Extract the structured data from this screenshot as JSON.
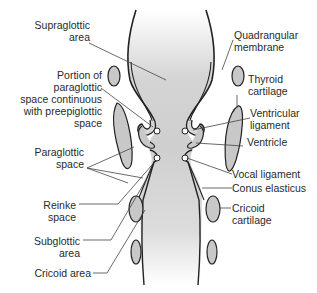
{
  "diagram": {
    "colors": {
      "line": "#222222",
      "cartilage_fill": "#c8c8c8",
      "lumen_fill": "#d0d0d0",
      "leader": "#444444",
      "background": "#ffffff"
    },
    "labels_left": [
      {
        "id": "supraglottic-area",
        "lines": [
          "Supraglottic",
          "area"
        ]
      },
      {
        "id": "portion-of-paraglottic-space",
        "lines": [
          "Portion of",
          "paraglottic",
          "space continuous",
          "with preepiglottic",
          "space"
        ]
      },
      {
        "id": "paraglottic-space",
        "lines": [
          "Paraglottic",
          "space"
        ]
      },
      {
        "id": "reinke-space",
        "lines": [
          "Reinke",
          "space"
        ]
      },
      {
        "id": "subglottic-area",
        "lines": [
          "Subglottic",
          "area"
        ]
      },
      {
        "id": "cricoid-area",
        "lines": [
          "Cricoid area"
        ]
      }
    ],
    "labels_right": [
      {
        "id": "quadrangular-membrane",
        "lines": [
          "Quadrangular",
          "membrane"
        ]
      },
      {
        "id": "thyroid-cartilage",
        "lines": [
          "Thyroid",
          "cartilage"
        ]
      },
      {
        "id": "ventricular-ligament",
        "lines": [
          "Ventricular",
          "ligament"
        ]
      },
      {
        "id": "ventricle",
        "lines": [
          "Ventricle"
        ]
      },
      {
        "id": "vocal-ligament",
        "lines": [
          "Vocal ligament"
        ]
      },
      {
        "id": "conus-elasticus",
        "lines": [
          "Conus elasticus"
        ]
      },
      {
        "id": "cricoid-cartilage",
        "lines": [
          "Cricoid",
          "cartilage"
        ]
      }
    ]
  }
}
